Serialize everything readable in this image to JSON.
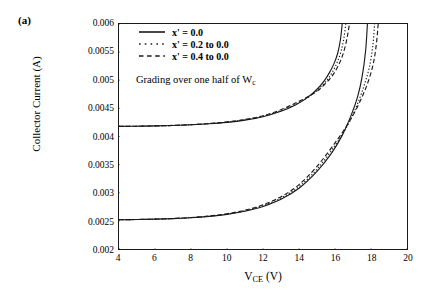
{
  "panel": {
    "label": "(a)"
  },
  "chart_data": {
    "type": "line",
    "title": "",
    "xlabel": "V_CE (V)",
    "xlabel_base": "V",
    "xlabel_sub": "CE",
    "xlabel_unit": " (V)",
    "ylabel": "Collector Current (A)",
    "xlim": [
      4,
      20
    ],
    "ylim": [
      0.002,
      0.006
    ],
    "xticks": [
      4,
      6,
      8,
      10,
      12,
      14,
      16,
      18,
      20
    ],
    "xtick_labels": [
      "4",
      "6",
      "8",
      "10",
      "12",
      "14",
      "16",
      "18",
      "20"
    ],
    "yticks": [
      0.002,
      0.0025,
      0.003,
      0.0035,
      0.004,
      0.0045,
      0.005,
      0.0055,
      0.006
    ],
    "ytick_labels": [
      "0.002",
      "0.0025",
      "0.003",
      "0.0035",
      "0.004",
      "0.0045",
      "0.005",
      "0.0055",
      "0.006"
    ],
    "grid": false,
    "legend_position": "upper-left-inside",
    "annotations": [
      {
        "text": "Grading over one half of Wc",
        "text_base": "Grading over one half of W",
        "text_sub": "c",
        "x": 7.2,
        "y": 0.00525
      }
    ],
    "series": [
      {
        "name": "x' = 0.0 (upper bias)",
        "legend_label": "x' = 0.0",
        "style": "solid",
        "color": "#1a1a1a",
        "group": "upper",
        "x": [
          4.0,
          5.0,
          6.0,
          7.0,
          8.0,
          9.0,
          10.0,
          11.0,
          12.0,
          13.0,
          13.8,
          14.5,
          15.0,
          15.4,
          15.7,
          15.95,
          16.15,
          16.3,
          16.4
        ],
        "y": [
          0.00418,
          0.004183,
          0.004188,
          0.004196,
          0.004208,
          0.004226,
          0.004252,
          0.004292,
          0.004352,
          0.004448,
          0.00456,
          0.0047,
          0.00484,
          0.00499,
          0.00514,
          0.0053,
          0.00548,
          0.00572,
          0.006
        ]
      },
      {
        "name": "x' = 0.2 to 0.0 (upper bias)",
        "legend_label": "x' = 0.2 to 0.0",
        "style": "dotted",
        "color": "#1a1a1a",
        "group": "upper",
        "x": [
          4.0,
          5.0,
          6.0,
          7.0,
          8.0,
          9.0,
          10.0,
          11.0,
          12.0,
          13.0,
          14.0,
          14.7,
          15.2,
          15.6,
          15.9,
          16.15,
          16.35,
          16.5,
          16.6
        ],
        "y": [
          0.00418,
          0.004183,
          0.004188,
          0.004196,
          0.004209,
          0.004228,
          0.004255,
          0.004297,
          0.00436,
          0.004462,
          0.004604,
          0.00474,
          0.00488,
          0.00502,
          0.00517,
          0.00534,
          0.00553,
          0.00576,
          0.006
        ]
      },
      {
        "name": "x' = 0.4 to 0.0 (upper bias)",
        "legend_label": "x' = 0.4 to 0.0",
        "style": "dashed",
        "color": "#1a1a1a",
        "group": "upper",
        "x": [
          4.0,
          5.0,
          6.0,
          7.0,
          8.0,
          9.0,
          10.0,
          11.0,
          12.0,
          13.0,
          14.0,
          14.9,
          15.4,
          15.8,
          16.1,
          16.35,
          16.55,
          16.7,
          16.8
        ],
        "y": [
          0.00418,
          0.004183,
          0.004188,
          0.004197,
          0.00421,
          0.00423,
          0.004259,
          0.004303,
          0.004369,
          0.004476,
          0.004626,
          0.00478,
          0.00492,
          0.00506,
          0.00521,
          0.00538,
          0.00558,
          0.0058,
          0.006
        ]
      },
      {
        "name": "x' = 0.0 (lower bias)",
        "legend_label": "x' = 0.0",
        "style": "solid",
        "color": "#1a1a1a",
        "group": "lower",
        "x": [
          4.0,
          5.0,
          6.0,
          7.0,
          8.0,
          9.0,
          10.0,
          11.0,
          12.0,
          13.0,
          14.0,
          15.0,
          15.8,
          16.4,
          16.9,
          17.25,
          17.5,
          17.7,
          17.8
        ],
        "y": [
          0.00252,
          0.002524,
          0.00253,
          0.00254,
          0.002556,
          0.00258,
          0.002616,
          0.002672,
          0.002756,
          0.002884,
          0.00308,
          0.00338,
          0.0037,
          0.00402,
          0.00438,
          0.0047,
          0.00505,
          0.00552,
          0.006
        ]
      },
      {
        "name": "x' = 0.2 to 0.0 (lower bias)",
        "legend_label": "x' = 0.2 to 0.0",
        "style": "dotted",
        "color": "#1a1a1a",
        "group": "lower",
        "x": [
          4.0,
          5.0,
          6.0,
          7.0,
          8.0,
          9.0,
          10.0,
          11.0,
          12.0,
          13.0,
          14.0,
          15.0,
          16.0,
          16.7,
          17.2,
          17.6,
          17.9,
          18.1,
          18.2
        ],
        "y": [
          0.00252,
          0.002524,
          0.00253,
          0.002541,
          0.002558,
          0.002583,
          0.002621,
          0.00268,
          0.00277,
          0.002906,
          0.00311,
          0.00342,
          0.00384,
          0.0042,
          0.00454,
          0.00489,
          0.00522,
          0.00561,
          0.006
        ]
      },
      {
        "name": "x' = 0.4 to 0.0 (lower bias)",
        "legend_label": "x' = 0.4 to 0.0",
        "style": "dashed",
        "color": "#1a1a1a",
        "group": "lower",
        "x": [
          4.0,
          5.0,
          6.0,
          7.0,
          8.0,
          9.0,
          10.0,
          11.0,
          12.0,
          13.0,
          14.0,
          15.0,
          16.1,
          16.9,
          17.5,
          17.9,
          18.15,
          18.3,
          18.4
        ],
        "y": [
          0.00252,
          0.002525,
          0.002531,
          0.002542,
          0.00256,
          0.002587,
          0.002627,
          0.00269,
          0.002786,
          0.00293,
          0.003145,
          0.00347,
          0.00393,
          0.00432,
          0.0047,
          0.00503,
          0.00533,
          0.00565,
          0.006
        ]
      }
    ],
    "legend": [
      {
        "label": "x' = 0.0",
        "style": "solid"
      },
      {
        "label": "x' = 0.2 to 0.0",
        "style": "dotted"
      },
      {
        "label": "x' = 0.4 to 0.0",
        "style": "dashed"
      }
    ]
  }
}
